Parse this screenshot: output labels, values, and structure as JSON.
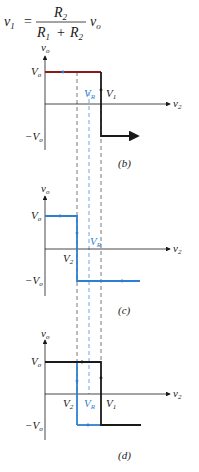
{
  "equation": {
    "lhs": "v",
    "lhs_sub": "1",
    "equals": "=",
    "num": "R",
    "num_sub": "2",
    "den1": "R",
    "den1_sub": "1",
    "plus": "+",
    "den2": "R",
    "den2_sub": "2",
    "rhs": "v",
    "rhs_sub": "o"
  },
  "colors": {
    "black": "#1a1a1a",
    "blue": "#2f7fd0",
    "dashed_blue": "#4a90d9",
    "red": "#8b1a1a"
  },
  "graphs": [
    {
      "id": "b",
      "caption": "(b)",
      "y_label": "v",
      "y_label_sub": "o",
      "x_label": "v",
      "x_label_sub": "2",
      "vo": "V",
      "vo_sub": "o",
      "neg_vo": "−V",
      "neg_vo_sub": "o",
      "labels": [
        {
          "t": "V",
          "s": "R"
        },
        {
          "t": "V",
          "s": "1"
        }
      ]
    },
    {
      "id": "c",
      "caption": "(c)",
      "y_label": "v",
      "y_label_sub": "o",
      "x_label": "v",
      "x_label_sub": "2",
      "vo": "V",
      "vo_sub": "o",
      "neg_vo": "−V",
      "neg_vo_sub": "o",
      "labels": [
        {
          "t": "V",
          "s": "2"
        },
        {
          "t": "V",
          "s": "R"
        }
      ]
    },
    {
      "id": "d",
      "caption": "(d)",
      "y_label": "v",
      "y_label_sub": "o",
      "x_label": "v",
      "x_label_sub": "2",
      "vo": "V",
      "vo_sub": "o",
      "neg_vo": "−V",
      "neg_vo_sub": "o",
      "labels": [
        {
          "t": "V",
          "s": "2"
        },
        {
          "t": "V",
          "s": "R"
        },
        {
          "t": "V",
          "s": "1"
        }
      ]
    }
  ]
}
